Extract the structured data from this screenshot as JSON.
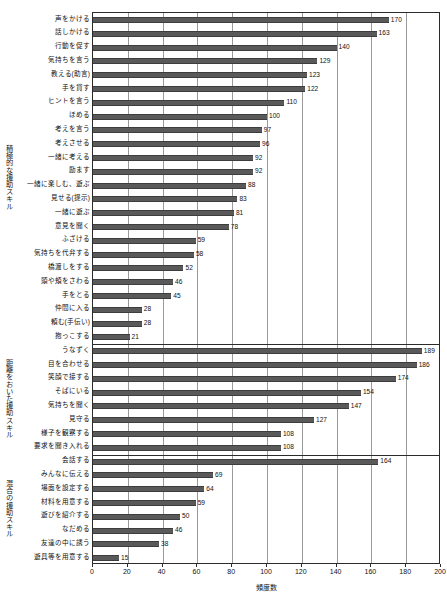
{
  "chart_data": {
    "type": "bar",
    "orientation": "horizontal",
    "title": "",
    "xlabel": "頻度数",
    "ylabel": "",
    "xlim": [
      0,
      200
    ],
    "xticks": [
      0,
      20,
      40,
      60,
      80,
      100,
      120,
      140,
      160,
      180,
      200
    ],
    "grid": true,
    "legend": "none",
    "bar_color": "#595959",
    "groups": [
      {
        "name": "積極的な援助スキル",
        "categories": [
          "声をかける",
          "話しかける",
          "行動を促す",
          "気持ちを言う",
          "教える(助言)",
          "手を貸す",
          "ヒントを言う",
          "ほめる",
          "考えを言う",
          "考えさせる",
          "一緒に考える",
          "励ます",
          "一緒に楽しむ、遊ぶ",
          "見せる(提示)",
          "一緒に遊ぶ",
          "意見を聞く",
          "ふざける",
          "気持ちを代弁する",
          "橋渡しをする",
          "頭や頬をさわる",
          "手をとる",
          "仲間に入る",
          "頼む(手伝い)",
          "抱っこする"
        ],
        "values": [
          170,
          163,
          140,
          129,
          123,
          122,
          110,
          100,
          97,
          96,
          92,
          92,
          88,
          83,
          81,
          78,
          59,
          58,
          52,
          46,
          45,
          28,
          28,
          21
        ]
      },
      {
        "name": "距離をおいた援助スキル",
        "categories": [
          "うなずく",
          "目を合わせる",
          "笑顔で接する",
          "そばにいる",
          "気持ちを聞く",
          "見守る",
          "様子を観察する",
          "要求を聞き入れる"
        ],
        "values": [
          189,
          186,
          174,
          154,
          147,
          127,
          108,
          108
        ]
      },
      {
        "name": "混合の援助スキル",
        "categories": [
          "会話する",
          "みんなに伝える",
          "場面を設定する",
          "材料を用意する",
          "遊びを紹介する",
          "なだめる",
          "友達の中に誘う",
          "遊具等を用意する"
        ],
        "values": [
          164,
          69,
          64,
          59,
          50,
          46,
          38,
          15
        ]
      }
    ]
  }
}
